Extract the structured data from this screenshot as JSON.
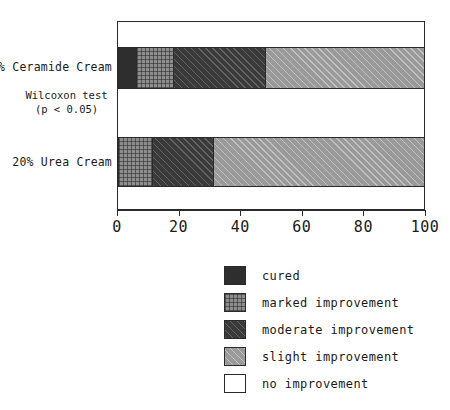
{
  "chart_data": {
    "type": "bar",
    "orientation": "horizontal",
    "stacked": true,
    "title": "",
    "xlabel": "",
    "ylabel": "",
    "xlim": [
      0,
      100
    ],
    "xticks": [
      0,
      20,
      40,
      60,
      80,
      100
    ],
    "grid": false,
    "legend_position": "bottom-center",
    "categories": [
      "8% Ceramide Cream",
      "20% Urea Cream"
    ],
    "series": [
      {
        "name": "cured",
        "values": [
          6,
          0
        ],
        "pattern": "solid-dark",
        "color": "#2e2e2e"
      },
      {
        "name": "marked improvement",
        "values": [
          12,
          11
        ],
        "pattern": "crosshatch-gray",
        "color": "#8d8d8d"
      },
      {
        "name": "moderate improvement",
        "values": [
          30,
          20
        ],
        "pattern": "diagonal-dark",
        "color": "#3a3a3a"
      },
      {
        "name": "slight improvement",
        "values": [
          52,
          69
        ],
        "pattern": "diagonal-light",
        "color": "#9a9a9a"
      },
      {
        "name": "no improvement",
        "values": [
          0,
          0
        ],
        "pattern": "empty-white",
        "color": "#ffffff"
      }
    ],
    "annotations": [
      "Wilcoxon test",
      "(p < 0.05)"
    ]
  },
  "axis": {
    "tick_labels": [
      "0",
      "20",
      "40",
      "60",
      "80",
      "100"
    ]
  },
  "categories": {
    "items": [
      {
        "label": "8% Ceramide Cream"
      },
      {
        "label": "20% Urea Cream"
      }
    ]
  },
  "annotation": {
    "line1": "Wilcoxon test",
    "line2": "(p < 0.05)"
  },
  "legend": {
    "items": [
      {
        "label": "cured"
      },
      {
        "label": "marked improvement"
      },
      {
        "label": "moderate improvement"
      },
      {
        "label": "slight improvement"
      },
      {
        "label": "no improvement"
      }
    ]
  }
}
